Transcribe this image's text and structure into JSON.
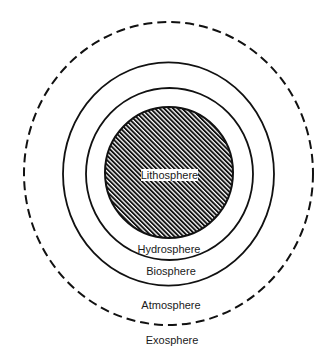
{
  "diagram": {
    "type": "concentric-spheres",
    "colors": {
      "background": "#ffffff",
      "line": "#111111",
      "hatch_line": "#111111",
      "hatch_gap": "#ffffff",
      "text": "#1a1a1a"
    },
    "layers": [
      {
        "name": "lithosphere",
        "label": "Lithosphere",
        "style": "hatched-disk",
        "label_position": "center-boxed"
      },
      {
        "name": "hydrosphere",
        "label": "Hydrosphere",
        "style": "solid-ring",
        "label_position": "below-inner-ring"
      },
      {
        "name": "biosphere",
        "label": "Biosphere",
        "style": "solid-ring",
        "label_position": "below-middle-ring"
      },
      {
        "name": "atmosphere",
        "label": "Atmosphere",
        "style": "dashed-ring",
        "label_position": "inside-dashed-ring"
      },
      {
        "name": "exosphere",
        "label": "Exosphere",
        "style": "outside",
        "label_position": "below-dashed-ring"
      }
    ]
  }
}
